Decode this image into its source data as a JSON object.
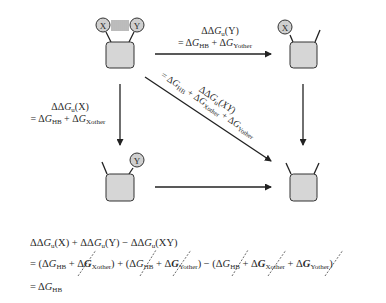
{
  "diagram": {
    "states": [
      {
        "id": "native",
        "label": "X–Y bonded",
        "residues": [
          "X",
          "Y"
        ],
        "hbond": true
      },
      {
        "id": "mut_y",
        "label": "X only",
        "residues": [
          "X"
        ]
      },
      {
        "id": "mut_x",
        "label": "Y only",
        "residues": [
          "Y"
        ]
      },
      {
        "id": "double",
        "label": "double mutant",
        "residues": []
      }
    ],
    "arrows": {
      "top": {
        "line1": "ΔΔGu(Y)",
        "line2": "= ΔGHB + ΔGYother"
      },
      "left": {
        "line1": "ΔΔGu(X)",
        "line2": "= ΔGHB + ΔGXother"
      },
      "diagonal": {
        "line1": "ΔΔGu(XY)",
        "line2": "= ΔGHB + ΔGXother + ΔGYother"
      }
    },
    "labels": {
      "dd": "ΔΔ",
      "d": "Δ",
      "G": "G",
      "u": "u",
      "HB": "HB",
      "Xother": "Xother",
      "Yother": "Yother",
      "X": "(X)",
      "Y": "(Y)",
      "XY": "(XY)",
      "eq": "=",
      "plus": "+",
      "resX": "X",
      "resY": "Y"
    }
  },
  "equation": {
    "line1": "ΔΔGu(X) + ΔΔGu(Y) − ΔΔGu(XY)",
    "line2": "= (ΔGHB + ΔGXother) + (ΔGHB + ΔGYother) − (ΔGHB + ΔGXother + ΔGYother)",
    "line3": "= ΔGHB",
    "cancelled_terms": [
      "ΔGXother",
      "ΔGHB",
      "ΔGYother",
      "ΔGHB",
      "ΔGXother",
      "ΔGYother"
    ]
  }
}
